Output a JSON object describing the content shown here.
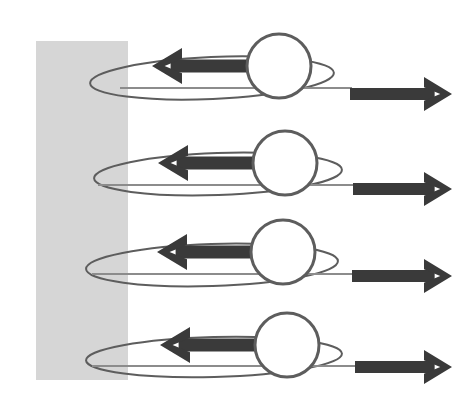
{
  "figure": {
    "name": "orbital-motion-near-wall-diagram",
    "kind": "physics-force-diagram",
    "background_color": "#ffffff",
    "width": 468,
    "height": 417
  },
  "wall": {
    "label": "",
    "color": "#d6d6d6",
    "x": 36,
    "y": 41,
    "width": 92,
    "height": 339
  },
  "colors": {
    "wall_gray": "#d6d6d6",
    "arrow_dark": "#3a3a3a",
    "outline_gray": "#5d5d5d",
    "thin_line_gray": "#8c8c8c",
    "circle_fill": "#ffffff"
  },
  "geometry": {
    "circle_radius": 32,
    "circle_stroke_width": 3,
    "loop_stroke_width": 2,
    "thin_line_width": 2,
    "arrow_shaft_height": 13,
    "right_arrow_shaft_height": 12
  },
  "rows": [
    {
      "id": "row-1",
      "center_y": 66,
      "circle_cx": 279,
      "loop": {
        "cx": 212,
        "cy": 78,
        "rx": 122,
        "ry": 21,
        "rotation": -2.5
      },
      "left_arrow": {
        "tail_x": 272,
        "tip_x": 152,
        "y": 66,
        "head_width": 30,
        "head_height": 36
      },
      "right_arrow": {
        "tail_x": 350,
        "tip_x": 452,
        "y": 94,
        "head_width": 28,
        "head_height": 34
      },
      "thin_line": {
        "x1": 120,
        "x2": 352,
        "y": 88
      }
    },
    {
      "id": "row-2",
      "center_y": 163,
      "circle_cx": 285,
      "loop": {
        "cx": 218,
        "cy": 174,
        "rx": 124,
        "ry": 21,
        "rotation": -2.0
      },
      "left_arrow": {
        "tail_x": 278,
        "tip_x": 158,
        "y": 163,
        "head_width": 30,
        "head_height": 36
      },
      "right_arrow": {
        "tail_x": 353,
        "tip_x": 452,
        "y": 189,
        "head_width": 28,
        "head_height": 34
      },
      "thin_line": {
        "x1": 98,
        "x2": 355,
        "y": 185
      }
    },
    {
      "id": "row-3",
      "center_y": 252,
      "circle_cx": 283,
      "loop": {
        "cx": 212,
        "cy": 265,
        "rx": 126,
        "ry": 21,
        "rotation": -1.8
      },
      "left_arrow": {
        "tail_x": 276,
        "tip_x": 157,
        "y": 252,
        "head_width": 30,
        "head_height": 36
      },
      "right_arrow": {
        "tail_x": 352,
        "tip_x": 452,
        "y": 276,
        "head_width": 28,
        "head_height": 34
      },
      "thin_line": {
        "x1": 92,
        "x2": 354,
        "y": 274
      }
    },
    {
      "id": "row-4",
      "center_y": 345,
      "circle_cx": 287,
      "loop": {
        "cx": 214,
        "cy": 357,
        "rx": 128,
        "ry": 20,
        "rotation": -1.5
      },
      "left_arrow": {
        "tail_x": 280,
        "tip_x": 160,
        "y": 345,
        "head_width": 30,
        "head_height": 36
      },
      "right_arrow": {
        "tail_x": 355,
        "tip_x": 452,
        "y": 367,
        "head_width": 28,
        "head_height": 34
      },
      "thin_line": {
        "x1": 92,
        "x2": 357,
        "y": 366
      }
    }
  ]
}
